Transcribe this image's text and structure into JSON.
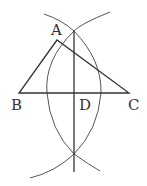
{
  "diagram": {
    "type": "geometric-construction",
    "labels": {
      "A": "A",
      "B": "B",
      "C": "C",
      "D": "D"
    },
    "points": {
      "A": [
        57,
        40
      ],
      "B": [
        19,
        93
      ],
      "C": [
        129,
        93
      ],
      "D": [
        74,
        93
      ],
      "top_intersection": [
        74,
        31
      ],
      "bottom_intersection": [
        74,
        154
      ]
    },
    "colors": {
      "line": "#333333",
      "arc": "#555555",
      "background": "#ffffff"
    }
  }
}
